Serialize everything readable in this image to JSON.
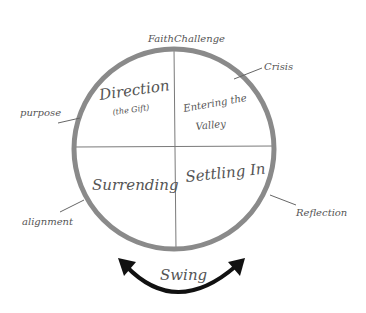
{
  "diagram": {
    "colors": {
      "ring": "#8a8a8a",
      "divider": "#7a7a7a",
      "text": "#555555",
      "arrow": "#111111",
      "background": "#ffffff"
    },
    "top_label": "FaithChallenge",
    "quadrants": [
      {
        "position": "top-left",
        "label": "Direction",
        "sublabel": "(the Gift)"
      },
      {
        "position": "top-right",
        "label": "Entering the",
        "label2": "Valley"
      },
      {
        "position": "bottom-left",
        "label": "Surrending"
      },
      {
        "position": "bottom-right",
        "label": "Settling In"
      }
    ],
    "callouts": [
      {
        "label": "Crisis",
        "side": "upper-right"
      },
      {
        "label": "purpose",
        "side": "upper-left"
      },
      {
        "label": "alignment",
        "side": "lower-left"
      },
      {
        "label": "Reflection",
        "side": "lower-right"
      }
    ],
    "bottom_arrow": {
      "label": "Swing",
      "direction": "bidirectional"
    }
  }
}
